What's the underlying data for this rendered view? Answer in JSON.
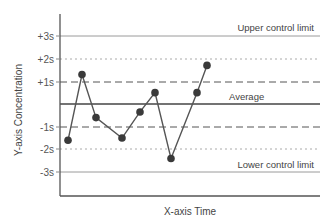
{
  "chart_data": {
    "type": "line",
    "title": "",
    "xlabel": "X-axis Time",
    "ylabel": "Y-axis Concentration",
    "ylim": [
      -3.5,
      4
    ],
    "grid": false,
    "legend": null,
    "y_ticks": [
      "+3s",
      "+2s",
      "+1s",
      "-1s",
      "-2s",
      "-3s"
    ],
    "reference_lines": [
      {
        "label": "+3s",
        "value": 3,
        "style": "solid",
        "annotation": "Upper control limit"
      },
      {
        "label": "+2s",
        "value": 2,
        "style": "dotted"
      },
      {
        "label": "+1s",
        "value": 1,
        "style": "dashed"
      },
      {
        "label": "Average",
        "value": 0,
        "style": "solid-bold",
        "annotation": "Average"
      },
      {
        "label": "-1s",
        "value": -1,
        "style": "dashed"
      },
      {
        "label": "-2s",
        "value": -2,
        "style": "dotted"
      },
      {
        "label": "-3s",
        "value": -3,
        "style": "solid",
        "annotation": "Lower control limit"
      }
    ],
    "series": [
      {
        "name": "Concentration",
        "x": [
          1,
          2,
          3,
          4,
          5,
          6,
          7,
          8,
          9
        ],
        "x_px": [
          68,
          82,
          96,
          122,
          140,
          155,
          171,
          197,
          207
        ],
        "values": [
          -1.6,
          1.3,
          -0.6,
          -1.5,
          -0.35,
          0.5,
          -2.4,
          0.5,
          1.7
        ]
      }
    ]
  },
  "labels": {
    "upper": "Upper control limit",
    "average": "Average",
    "lower": "Lower control limit",
    "xlabel": "X-axis Time",
    "ylabel": "Y-axis Concentration",
    "ticks": {
      "p3": "+3s",
      "p2": "+2s",
      "p1": "+1s",
      "m1": "-1s",
      "m2": "-2s",
      "m3": "-3s"
    }
  },
  "colors": {
    "axis": "#444444",
    "line": "#555555",
    "marker": "#3a3a3a",
    "limit": "#999999",
    "dotted": "#aaaaaa",
    "dashed": "#555555"
  }
}
